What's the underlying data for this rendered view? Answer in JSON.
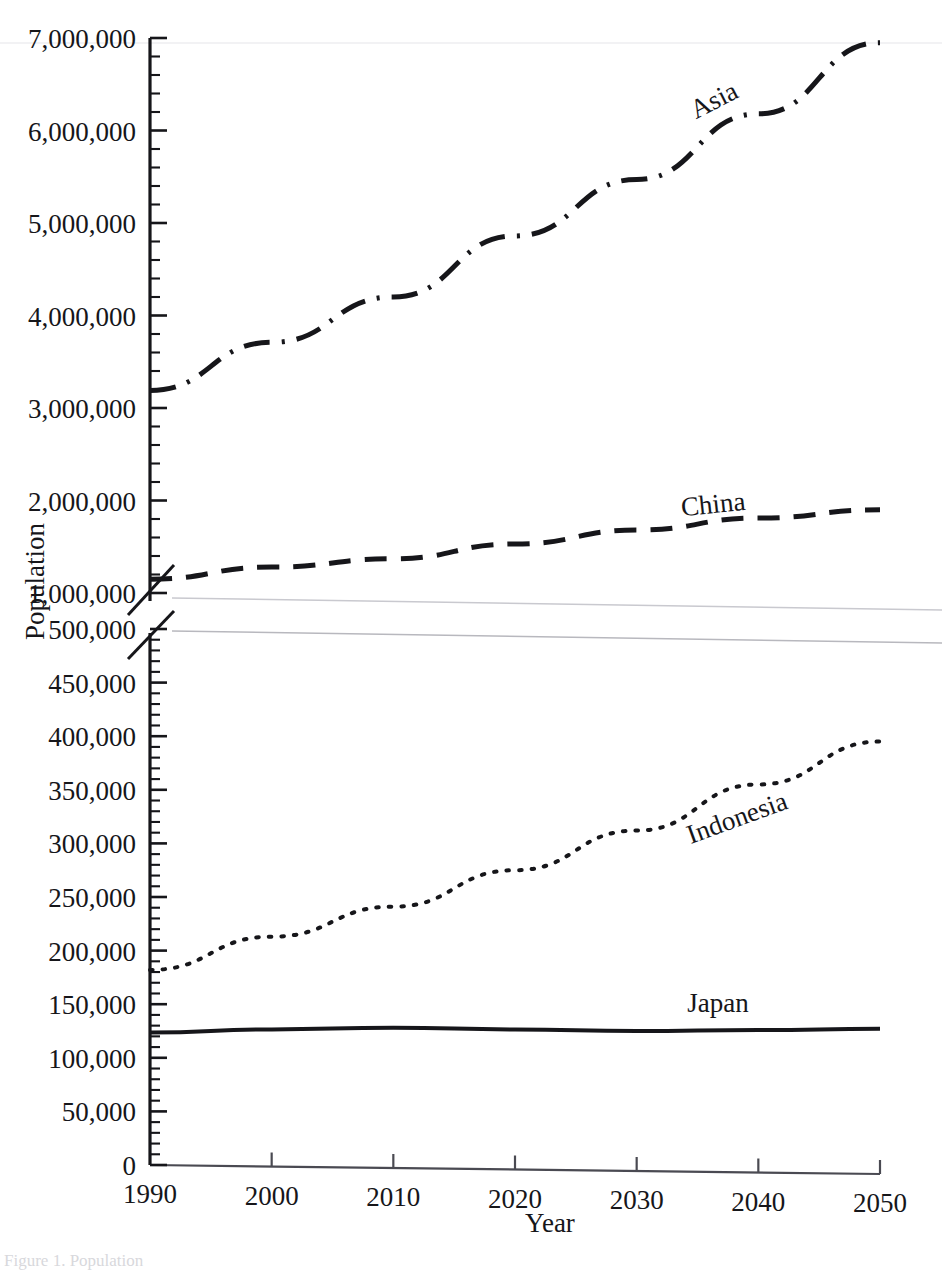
{
  "figure": {
    "caption_fragment": "Figure 1. Population"
  },
  "chart_data": {
    "type": "line",
    "title": "",
    "xlabel": "Year",
    "ylabel": "Population",
    "grid": false,
    "legend_position": "inline-labels",
    "broken_axis": true,
    "x": [
      1990,
      2000,
      2010,
      2020,
      2030,
      2040,
      2050
    ],
    "xlim": [
      1990,
      2050
    ],
    "xticks": [
      "1990",
      "2000",
      "2010",
      "2020",
      "2030",
      "2040",
      "2050"
    ],
    "upper_panel": {
      "ylim": [
        1000000,
        7000000
      ],
      "yticks": [
        "1,000,000",
        "2,000,000",
        "3,000,000",
        "4,000,000",
        "5,000,000",
        "6,000,000",
        "7,000,000"
      ],
      "ytick_values": [
        1000000,
        2000000,
        3000000,
        4000000,
        5000000,
        6000000,
        7000000
      ],
      "minor_tick_step": 200000
    },
    "lower_panel": {
      "ylim": [
        0,
        500000
      ],
      "yticks": [
        "0",
        "50,000",
        "100,000",
        "150,000",
        "200,000",
        "250,000",
        "300,000",
        "350,000",
        "400,000",
        "450,000",
        "500,000"
      ],
      "ytick_values": [
        0,
        50000,
        100000,
        150000,
        200000,
        250000,
        300000,
        350000,
        400000,
        450000,
        500000
      ],
      "minor_tick_step": 10000
    },
    "series": [
      {
        "name": "Asia",
        "label": "Asia",
        "panel": "upper",
        "style": "dash-dot",
        "color": "#16161a",
        "width": 5,
        "values": [
          3190000,
          3710000,
          4200000,
          4860000,
          5470000,
          6180000,
          6950000
        ]
      },
      {
        "name": "China",
        "label": "China",
        "panel": "upper",
        "style": "dashed",
        "color": "#16161a",
        "width": 5,
        "values": [
          1150000,
          1280000,
          1370000,
          1530000,
          1680000,
          1810000,
          1900000
        ]
      },
      {
        "name": "Indonesia",
        "label": "Indonesia",
        "panel": "lower",
        "style": "dotted",
        "color": "#16161a",
        "width": 4,
        "values": [
          182000,
          213000,
          241000,
          275000,
          312000,
          355000,
          395000
        ]
      },
      {
        "name": "Japan",
        "label": "Japan",
        "panel": "lower",
        "style": "solid",
        "color": "#16161a",
        "width": 4,
        "values": [
          123500,
          126500,
          128000,
          126500,
          125000,
          126000,
          127000
        ]
      }
    ]
  }
}
